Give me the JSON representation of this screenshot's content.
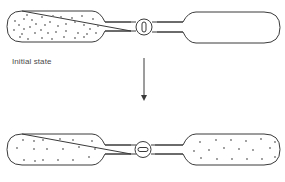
{
  "diagram": {
    "type": "gas-expansion-two-vessels",
    "stroke_color": "#3a3a3a",
    "particle_color": "#777777",
    "labels": {
      "initial": "Initial state"
    },
    "states": [
      {
        "name": "initial",
        "valve": "closed",
        "left_vessel": "filled",
        "right_vessel": "empty"
      },
      {
        "name": "final",
        "valve": "open",
        "left_vessel": "filled",
        "right_vessel": "filled"
      }
    ],
    "arrow": {
      "direction": "down"
    }
  }
}
